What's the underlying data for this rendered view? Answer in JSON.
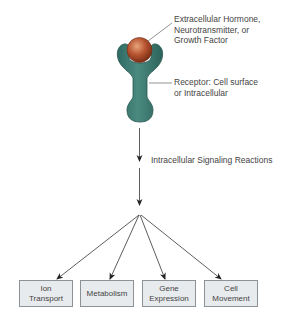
{
  "ligand_label": {
    "line1": "Extracellular Hormone,",
    "line2": "Neurotransmitter, or",
    "line3": "Growth Factor"
  },
  "receptor_label": {
    "line1": "Receptor: Cell surface",
    "line2": "or Intracellular"
  },
  "signaling_label": "Intracellular Signaling Reactions",
  "outcomes": [
    {
      "line1": "Ion",
      "line2": "Transport"
    },
    {
      "line1": "Metabolism",
      "line2": ""
    },
    {
      "line1": "Gene",
      "line2": "Expression"
    },
    {
      "line1": "Cell",
      "line2": "Movement"
    }
  ],
  "colors": {
    "receptor": "#3f7b72",
    "ligand": "#b5532e",
    "box_fill": "#e8ebee",
    "box_border": "#8d9297",
    "arrow": "#333333"
  }
}
